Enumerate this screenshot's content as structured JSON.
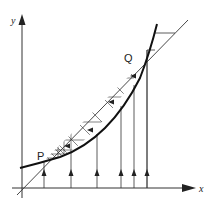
{
  "diagram": {
    "title": "",
    "axes": {
      "x_label": "x",
      "y_label": "y"
    },
    "points": [
      {
        "label": "P",
        "description": "lower intersection of curve and line y=x"
      },
      {
        "label": "Q",
        "description": "upper intersection of curve and line y=x"
      }
    ],
    "elements": [
      "y = x diagonal line",
      "convex curve y = f(x) intersecting diagonal at P and Q",
      "cobweb/staircase iteration between curve and diagonal, hatched region between P and Q",
      "vertical upward arrows from x-axis to curve"
    ],
    "colors": {
      "ink": "#222222",
      "background": "#ffffff"
    }
  }
}
